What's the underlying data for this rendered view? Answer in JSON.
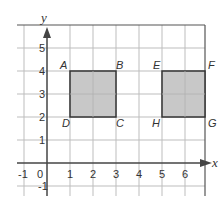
{
  "diagram": {
    "type": "coordinate-grid",
    "axes": {
      "x_label": "x",
      "y_label": "y",
      "x_range": [
        -1,
        7
      ],
      "y_range": [
        -1,
        6
      ]
    },
    "x_ticks": [
      "-1",
      "0",
      "1",
      "2",
      "3",
      "4",
      "5",
      "6"
    ],
    "y_ticks": [
      "1",
      "2",
      "3",
      "4",
      "5"
    ],
    "y_neg_tick": "-1",
    "shapes": [
      {
        "name": "ABCD",
        "vertices": {
          "A": [
            1,
            4
          ],
          "B": [
            3,
            4
          ],
          "C": [
            3,
            2
          ],
          "D": [
            1,
            2
          ]
        },
        "fill": "#c8c8c8"
      },
      {
        "name": "EFGH",
        "vertices": {
          "E": [
            5,
            4
          ],
          "F": [
            7,
            4
          ],
          "G": [
            7,
            2
          ],
          "H": [
            5,
            2
          ]
        },
        "fill": "#c8c8c8"
      }
    ],
    "point_labels": {
      "A": "A",
      "B": "B",
      "C": "C",
      "D": "D",
      "E": "E",
      "F": "F",
      "G": "G",
      "H": "H"
    },
    "colors": {
      "grid": "#bdbdbd",
      "axis": "#444444",
      "shape_fill": "#c8c8c8",
      "shape_stroke": "#333333"
    }
  }
}
